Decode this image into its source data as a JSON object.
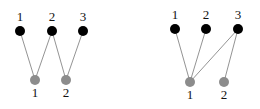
{
  "graphs": [
    {
      "name": "left-graph",
      "top_nodes": [
        {
          "label": "1",
          "x": 20,
          "y": 31
        },
        {
          "label": "2",
          "x": 52,
          "y": 31
        },
        {
          "label": "3",
          "x": 83,
          "y": 31
        }
      ],
      "bottom_nodes": [
        {
          "label": "1",
          "x": 35,
          "y": 80
        },
        {
          "label": "2",
          "x": 66,
          "y": 80
        }
      ],
      "edges": [
        [
          0,
          0
        ],
        [
          1,
          0
        ],
        [
          1,
          1
        ],
        [
          2,
          1
        ]
      ]
    },
    {
      "name": "right-graph",
      "top_nodes": [
        {
          "label": "1",
          "x": 175,
          "y": 29
        },
        {
          "label": "2",
          "x": 206,
          "y": 29
        },
        {
          "label": "3",
          "x": 238,
          "y": 29
        }
      ],
      "bottom_nodes": [
        {
          "label": "1",
          "x": 190,
          "y": 82
        },
        {
          "label": "2",
          "x": 224,
          "y": 82
        }
      ],
      "edges": [
        [
          0,
          0
        ],
        [
          1,
          0
        ],
        [
          2,
          0
        ],
        [
          2,
          1
        ]
      ]
    }
  ],
  "colors": {
    "top_node": "#000000",
    "bottom_node": "#8c8c8c",
    "edge": "#777777"
  }
}
